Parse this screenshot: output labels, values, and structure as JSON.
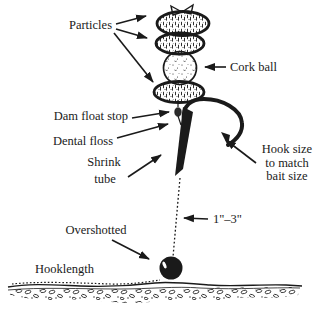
{
  "diagram": {
    "type": "fishing-rig-diagram",
    "labels": {
      "particles": "Particles",
      "cork_ball": "Cork ball",
      "dam_float_stop": "Dam float stop",
      "dental_floss": "Dental floss",
      "shrink_tube": [
        "Shrink",
        "tube"
      ],
      "hook_size": [
        "Hook size",
        "to match",
        "bait size"
      ],
      "length_range": "1\"–3\"",
      "overshotted": "Overshotted",
      "hooklength": "Hooklength"
    },
    "parts": [
      "particle-bait-top",
      "particle-bait-second",
      "cork-ball",
      "particle-bait-bottom",
      "dam-float-stop-bead",
      "dental-floss-hair",
      "shrink-tube-on-shank",
      "hook",
      "line-to-shot",
      "shot-weight",
      "lake-bottom"
    ],
    "colors": {
      "ink": "#1a1a1a",
      "background": "#ffffff"
    }
  }
}
